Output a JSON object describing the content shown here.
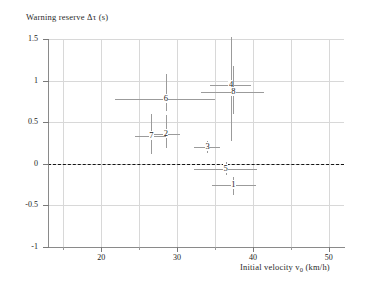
{
  "chart_data": {
    "type": "scatter",
    "title": "",
    "ylabel": "Warning reserve  Δτ (s)",
    "xlabel_text": "Initial velocity  v",
    "xlabel_sub": "0",
    "xlabel_units": " (km/h)",
    "xlim": [
      13,
      52
    ],
    "ylim": [
      -1,
      1.5
    ],
    "grid": true,
    "legend": "none",
    "yticks": [
      1.5,
      1,
      0.5,
      0,
      -0.5,
      -1
    ],
    "ytick_labels": [
      "1.5",
      "1",
      "0.5",
      "0",
      "-0.5",
      "-1"
    ],
    "xticks": [
      20,
      30,
      40,
      50
    ],
    "xtick_labels": [
      "20",
      "30",
      "40",
      "50"
    ],
    "xticks_minor": [
      15,
      25,
      35,
      45
    ],
    "zero_reference_line": 0,
    "points": [
      {
        "label": "1",
        "x": 37.4,
        "y": -0.26,
        "xerr_low": 34.6,
        "xerr_high": 40.4,
        "yerr_low": -0.37,
        "yerr_high": -0.16
      },
      {
        "label": "2",
        "x": 28.5,
        "y": 0.36,
        "xerr_low": 26.6,
        "xerr_high": 30.4,
        "yerr_low": 0.19,
        "yerr_high": 0.59
      },
      {
        "label": "3",
        "x": 34.0,
        "y": 0.2,
        "xerr_low": 32.3,
        "xerr_high": 35.6,
        "yerr_low": 0.13,
        "yerr_high": 0.27
      },
      {
        "label": "4",
        "x": 37.1,
        "y": 0.95,
        "xerr_low": 34.3,
        "xerr_high": 39.7,
        "yerr_low": 0.27,
        "yerr_high": 1.53
      },
      {
        "label": "5",
        "x": 36.4,
        "y": -0.06,
        "xerr_low": 32.3,
        "xerr_high": 40.5,
        "yerr_low": -0.13,
        "yerr_high": 0.02
      },
      {
        "label": "6",
        "x": 28.5,
        "y": 0.78,
        "xerr_low": 21.8,
        "xerr_high": 35.0,
        "yerr_low": 0.64,
        "yerr_high": 1.08
      },
      {
        "label": "7",
        "x": 26.6,
        "y": 0.34,
        "xerr_low": 24.5,
        "xerr_high": 28.6,
        "yerr_low": 0.12,
        "yerr_high": 0.6
      },
      {
        "label": "8",
        "x": 37.4,
        "y": 0.86,
        "xerr_low": 33.2,
        "xerr_high": 41.5,
        "yerr_low": 0.6,
        "yerr_high": 1.18
      }
    ]
  }
}
